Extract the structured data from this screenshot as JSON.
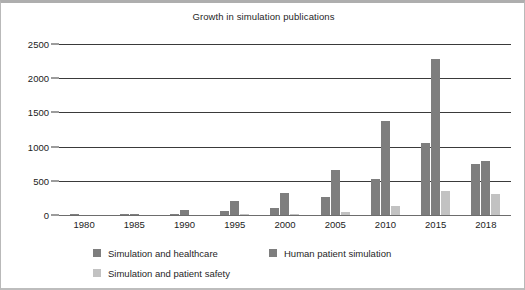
{
  "chart_data": {
    "type": "bar",
    "title": "Growth in simulation publications",
    "xlabel": "",
    "ylabel": "",
    "ylim": [
      0,
      2500
    ],
    "yticks": [
      0,
      500,
      1000,
      1500,
      2000,
      2500
    ],
    "grid": true,
    "legend_position": "bottom-left",
    "categories": [
      "1980",
      "1985",
      "1990",
      "1995",
      "2000",
      "2005",
      "2010",
      "2015",
      "2018"
    ],
    "series": [
      {
        "name": "Simulation and healthcare",
        "color": "#7e7e7e",
        "values": [
          2,
          18,
          15,
          65,
          105,
          270,
          530,
          1050,
          740
        ]
      },
      {
        "name": "Human patient simulation",
        "color": "#7e7e7e",
        "values": [
          0,
          4,
          80,
          200,
          320,
          660,
          1370,
          2280,
          790
        ]
      },
      {
        "name": "Simulation and patient safety",
        "color": "#c2c2c2",
        "values": [
          0,
          0,
          0,
          8,
          15,
          40,
          130,
          355,
          300
        ]
      }
    ]
  },
  "legend": {
    "entries": [
      {
        "label": "Simulation and healthcare",
        "swatch": "s0"
      },
      {
        "label": "Human patient simulation",
        "swatch": "s1"
      },
      {
        "label": "Simulation and patient safety",
        "swatch": "s2"
      }
    ]
  }
}
